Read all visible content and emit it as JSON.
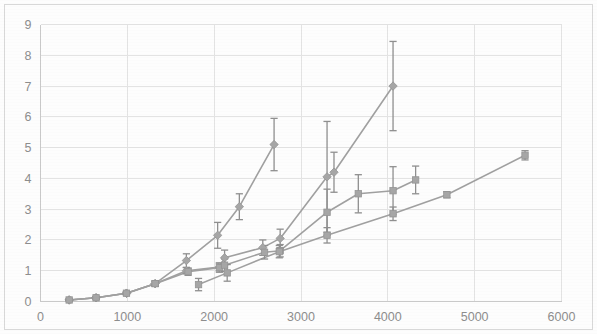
{
  "chart_data": {
    "type": "line",
    "title": "",
    "subtitle": "",
    "xlabel": "",
    "ylabel": "",
    "xlim": [
      0,
      6000
    ],
    "ylim": [
      0,
      9
    ],
    "xticks": [
      0,
      1000,
      2000,
      3000,
      4000,
      5000,
      6000
    ],
    "yticks": [
      0,
      1,
      2,
      3,
      4,
      5,
      6,
      7,
      8,
      9
    ],
    "xtick_labels": [
      "0",
      "1000",
      "2000",
      "3000",
      "4000",
      "5000",
      "6000"
    ],
    "ytick_labels": [
      "0",
      "1",
      "2",
      "3",
      "4",
      "5",
      "6",
      "7",
      "8",
      "9"
    ],
    "grid": true,
    "grid_color": "#e3e3e3",
    "legend": "none",
    "marker_color": "#a6a6a6",
    "line_color": "#a0a0a0",
    "errorbar_color": "#8f8f8f",
    "series": [
      {
        "name": "series-1",
        "marker": "diamond",
        "x": [
          330,
          640,
          990,
          1320,
          1680,
          2040,
          2290,
          2690
        ],
        "y": [
          0.05,
          0.12,
          0.27,
          0.58,
          1.33,
          2.15,
          3.08,
          5.1
        ],
        "yerr": [
          0.03,
          0.04,
          0.05,
          0.08,
          0.22,
          0.42,
          0.42,
          0.85
        ]
      },
      {
        "name": "series-2",
        "marker": "diamond",
        "x": [
          330,
          640,
          990,
          1320,
          1680,
          2060,
          2120,
          2560,
          2760,
          3300,
          3380,
          4060
        ],
        "y": [
          0.05,
          0.12,
          0.27,
          0.58,
          1.0,
          1.12,
          1.42,
          1.75,
          2.05,
          4.05,
          4.2,
          7.0
        ],
        "yerr": [
          0.03,
          0.04,
          0.05,
          0.08,
          0.1,
          0.13,
          0.25,
          0.25,
          0.3,
          1.8,
          0.65,
          1.45
        ]
      },
      {
        "name": "series-3",
        "marker": "square",
        "x": [
          330,
          640,
          990,
          1320,
          1700,
          2060,
          2120,
          2580,
          2760,
          3300,
          3660,
          4060,
          4320
        ],
        "y": [
          0.05,
          0.12,
          0.27,
          0.58,
          0.97,
          1.1,
          1.18,
          1.6,
          1.65,
          2.9,
          3.5,
          3.6,
          3.95
        ],
        "yerr": [
          0.03,
          0.04,
          0.05,
          0.08,
          0.12,
          0.15,
          0.2,
          0.22,
          0.2,
          0.75,
          0.62,
          0.78,
          0.45
        ]
      },
      {
        "name": "series-4",
        "marker": "square",
        "x": [
          1820,
          2150,
          2750,
          3300,
          4060,
          4680,
          5580
        ],
        "y": [
          0.55,
          0.93,
          1.62,
          2.15,
          2.85,
          3.47,
          4.75
        ],
        "yerr": [
          0.2,
          0.27,
          0.2,
          0.25,
          0.22,
          0.1,
          0.15
        ]
      }
    ]
  },
  "axes": {
    "x_axis_name": "x-axis",
    "y_axis_name": "y-axis"
  }
}
